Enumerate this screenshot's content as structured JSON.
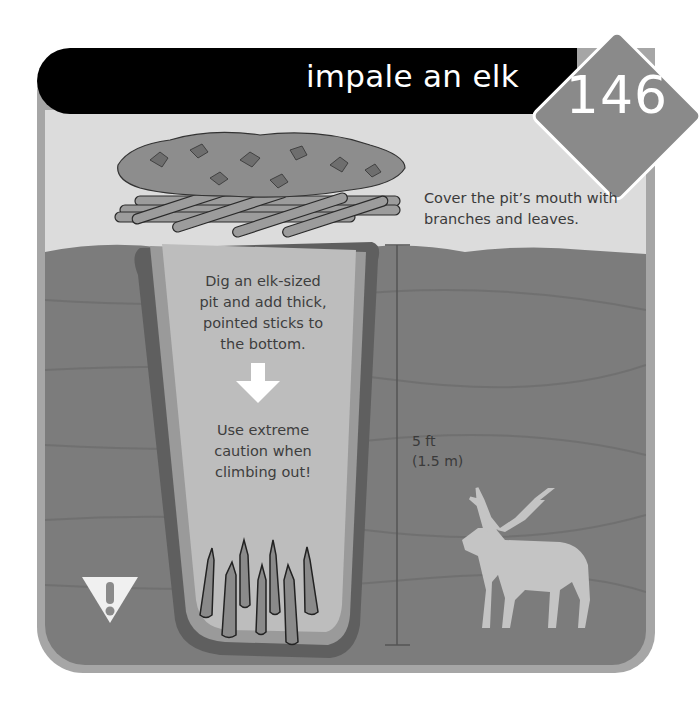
{
  "header": {
    "title": "impale an elk",
    "number": "146"
  },
  "captions": {
    "cover": [
      "Cover the pit’s mouth with",
      "branches and leaves."
    ],
    "dig": [
      "Dig an elk-sized",
      "pit and add thick,",
      "pointed sticks to",
      "the bottom."
    ],
    "caution": [
      "Use extreme",
      "caution when",
      "climbing out!"
    ]
  },
  "measurement": {
    "imperial": "5 ft",
    "metric": "(1.5 m)"
  },
  "icons": {
    "warning": "warning-triangle-icon",
    "arrow": "arrow-down-icon",
    "elk": "elk-silhouette-icon"
  },
  "colors": {
    "header_bg": "#000000",
    "badge_bg": "#8a8a8a",
    "frame": "#a6a6a6",
    "sky": "#dcdcdc",
    "ground": "#7a7a7a",
    "pit": "#bdbdbd",
    "elk": "#c4c4c4"
  }
}
